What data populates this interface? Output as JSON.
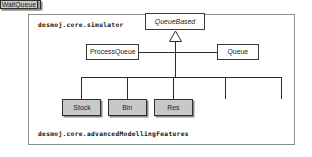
{
  "diagram": {
    "type": "uml-class-diagram",
    "packages": {
      "top_label": "desmoj.core.simulator",
      "bottom_label": "desmoj.core.advancedModellingFeatures"
    },
    "classes": {
      "queuebased": {
        "name": "QueueBased",
        "stereotype": "abstract",
        "fill": "#ffffff"
      },
      "processqueue": {
        "name": "ProcessQueue",
        "stereotype": "concrete",
        "fill": "#ffffff"
      },
      "queue": {
        "name": "Queue",
        "stereotype": "concrete",
        "fill": "#ffffff"
      },
      "stock": {
        "name": "Stock",
        "stereotype": "concrete",
        "fill": "#c8c8c8"
      },
      "bin": {
        "name": "Bin",
        "stereotype": "concrete",
        "fill": "#c8c8c8"
      },
      "res": {
        "name": "Res",
        "stereotype": "concrete",
        "fill": "#c8c8c8"
      },
      "condqueue": {
        "name": "CondQueue",
        "stereotype": "concrete",
        "fill": "#c8c8c8"
      },
      "waitqueue": {
        "name": "WaitQueue",
        "stereotype": "concrete",
        "fill": "#c8c8c8"
      }
    },
    "relationships": [
      {
        "kind": "generalization",
        "from": "ProcessQueue",
        "to": "QueueBased"
      },
      {
        "kind": "generalization",
        "from": "Queue",
        "to": "QueueBased"
      },
      {
        "kind": "generalization",
        "from": "Stock",
        "to": "QueueBased"
      },
      {
        "kind": "generalization",
        "from": "Bin",
        "to": "QueueBased"
      },
      {
        "kind": "generalization",
        "from": "Res",
        "to": "QueueBased"
      },
      {
        "kind": "generalization",
        "from": "CondQueue",
        "to": "QueueBased"
      },
      {
        "kind": "generalization",
        "from": "WaitQueue",
        "to": "QueueBased"
      }
    ],
    "colors": {
      "frame_border": "#8d8d8d",
      "box_border": "#2e2e2e",
      "connector": "#2b2b2b",
      "shaded_fill": "#c8c8c8",
      "shadow": "#8a8a8a",
      "background": "#ffffff"
    }
  }
}
